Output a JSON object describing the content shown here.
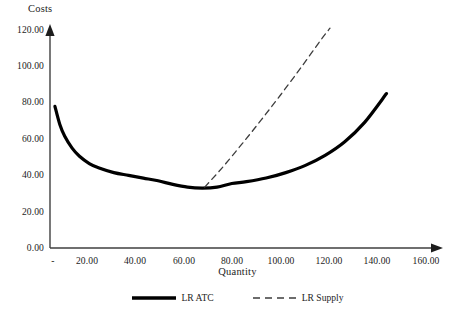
{
  "chart_data": {
    "type": "line",
    "title": "",
    "xlabel": "Quantity",
    "ylabel": "Costs",
    "xlim": [
      0,
      160
    ],
    "ylim": [
      0,
      120
    ],
    "grid": false,
    "legend_position": "bottom-center",
    "x_ticks": [
      "-",
      "20.00",
      "40.00",
      "60.00",
      "80.00",
      "100.00",
      "120.00",
      "140.00",
      "160.00"
    ],
    "x_tick_values": [
      0,
      20,
      40,
      60,
      80,
      100,
      120,
      140,
      160
    ],
    "y_ticks": [
      "0.00",
      "20.00",
      "40.00",
      "60.00",
      "80.00",
      "100.00",
      "120.00"
    ],
    "y_tick_values": [
      0,
      20,
      40,
      60,
      80,
      100,
      120
    ],
    "series": [
      {
        "name": "LR ATC",
        "style": "solid",
        "color": "#000000",
        "width": 3.2,
        "x": [
          2,
          4,
          6,
          9,
          12,
          16,
          20,
          26,
          32,
          38,
          44,
          50,
          56,
          62,
          68,
          74,
          80,
          88,
          96,
          104,
          112,
          120,
          128,
          137
        ],
        "y": [
          78.0,
          68.0,
          61.5,
          55.0,
          50.5,
          46.5,
          44.0,
          41.5,
          40.0,
          38.5,
          37.0,
          35.0,
          33.5,
          33.0,
          33.5,
          35.5,
          36.5,
          38.5,
          41.5,
          45.5,
          51.0,
          58.5,
          69.0,
          85.0
        ]
      },
      {
        "name": "LR Supply",
        "style": "dashed",
        "color": "#3d3d3d",
        "width": 1.3,
        "x": [
          63,
          70,
          78,
          86,
          94,
          102,
          110,
          114
        ],
        "y": [
          33.5,
          44.0,
          57.0,
          70.5,
          84.5,
          99.0,
          114.0,
          121.0
        ]
      }
    ],
    "legend": [
      {
        "label": "LR ATC",
        "style": "solid"
      },
      {
        "label": "LR Supply",
        "style": "dashed"
      }
    ],
    "axes": {
      "x_arrow": true,
      "y_arrow": true,
      "axis_color": "#3f3f3f"
    }
  }
}
